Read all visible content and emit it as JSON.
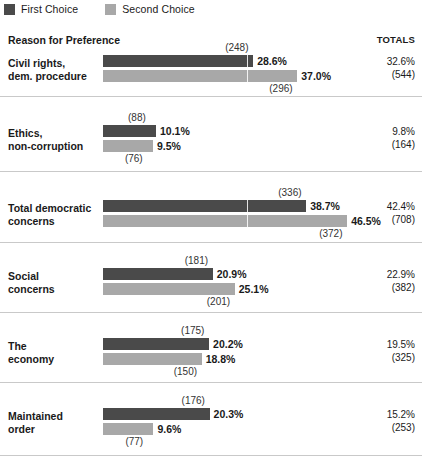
{
  "legend": {
    "items": [
      {
        "label": "First Choice",
        "swatch": "first-choice-swatch",
        "color": "#4a4a4a"
      },
      {
        "label": "Second Choice",
        "swatch": "second-choice-swatch",
        "color": "#a8a8a8"
      }
    ]
  },
  "header": {
    "reason_label": "Reason for Preference",
    "totals_label": "TOTALS"
  },
  "chart_data": {
    "type": "bar",
    "orientation": "horizontal",
    "title": "Reason for Preference",
    "xlabel": "",
    "ylabel": "",
    "grid": false,
    "legend_position": "top-left",
    "value_unit": "%",
    "categories": [
      "Civil rights, dem. procedure",
      "Ethics, non-corruption",
      "Total democratic concerns",
      "Social concerns",
      "The economy",
      "Maintained order"
    ],
    "series": [
      {
        "name": "First Choice",
        "color": "#4a4a4a",
        "values": [
          28.6,
          10.1,
          38.7,
          20.9,
          20.2,
          20.3
        ],
        "counts": [
          248,
          88,
          336,
          181,
          175,
          176
        ]
      },
      {
        "name": "Second Choice",
        "color": "#a8a8a8",
        "values": [
          37.0,
          9.5,
          46.5,
          25.1,
          18.8,
          9.6
        ],
        "counts": [
          296,
          76,
          372,
          201,
          150,
          77
        ]
      }
    ],
    "totals": {
      "percents": [
        32.6,
        9.8,
        42.4,
        22.9,
        19.5,
        15.2
      ],
      "counts": [
        544,
        164,
        708,
        382,
        325,
        253
      ]
    }
  },
  "rows": [
    {
      "label_line1": "Civil rights,",
      "label_line2": "dem. procedure",
      "first": {
        "pct": "28.6%",
        "count": "(248)",
        "value": 28.6
      },
      "second": {
        "pct": "37.0%",
        "count": "(296)",
        "value": 37.0
      },
      "totals": {
        "pct": "32.6%",
        "count": "(544)"
      }
    },
    {
      "label_line1": "Ethics,",
      "label_line2": "non-corruption",
      "first": {
        "pct": "10.1%",
        "count": "(88)",
        "value": 10.1
      },
      "second": {
        "pct": "9.5%",
        "count": "(76)",
        "value": 9.5
      },
      "totals": {
        "pct": "9.8%",
        "count": "(164)"
      }
    },
    {
      "label_line1": "Total democratic",
      "label_line2": "concerns",
      "first": {
        "pct": "38.7%",
        "count": "(336)",
        "value": 38.7
      },
      "second": {
        "pct": "46.5%",
        "count": "(372)",
        "value": 46.5
      },
      "totals": {
        "pct": "42.4%",
        "count": "(708)"
      }
    },
    {
      "label_line1": "Social",
      "label_line2": "concerns",
      "first": {
        "pct": "20.9%",
        "count": "(181)",
        "value": 20.9
      },
      "second": {
        "pct": "25.1%",
        "count": "(201)",
        "value": 25.1
      },
      "totals": {
        "pct": "22.9%",
        "count": "(382)"
      }
    },
    {
      "label_line1": "The",
      "label_line2": "economy",
      "first": {
        "pct": "20.2%",
        "count": "(175)",
        "value": 20.2
      },
      "second": {
        "pct": "18.8%",
        "count": "(150)",
        "value": 18.8
      },
      "totals": {
        "pct": "19.5%",
        "count": "(325)"
      }
    },
    {
      "label_line1": "Maintained",
      "label_line2": "order",
      "first": {
        "pct": "20.3%",
        "count": "(176)",
        "value": 20.3
      },
      "second": {
        "pct": "9.6%",
        "count": "(77)",
        "value": 9.6
      },
      "totals": {
        "pct": "15.2%",
        "count": "(253)"
      }
    }
  ],
  "layout": {
    "bar_origin_x": 103,
    "px_per_percent": 5.25,
    "row_tops": [
      55,
      125,
      200,
      268,
      338,
      408
    ],
    "separator_tops": [
      96,
      171,
      242,
      312,
      382,
      455
    ],
    "gridmark_percent": 27.5
  }
}
